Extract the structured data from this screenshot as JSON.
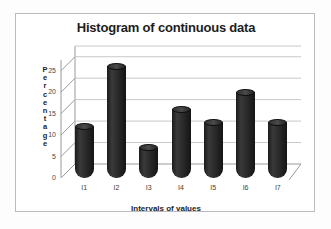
{
  "chart_data": {
    "type": "bar",
    "title": "Histogram of continuous data",
    "xlabel": "Intervals of values",
    "ylabel": "Percentage",
    "ylabel_letters": [
      "P",
      "e",
      "r",
      "c",
      "e",
      "n",
      "t",
      "a",
      "g",
      "e"
    ],
    "categories": [
      "I1",
      "I2",
      "I3",
      "I4",
      "I5",
      "I6",
      "I7"
    ],
    "values": [
      12,
      26,
      7,
      16,
      13,
      20,
      13
    ],
    "yticks": [
      0,
      5,
      10,
      15,
      20,
      25
    ],
    "ylim": [
      0,
      27.5
    ],
    "grid": true,
    "legend": "none",
    "style": "3d-cylinder",
    "bar_color": "#262626",
    "grid_color": "#c9c9c9",
    "axis_color": "#9a9a9a",
    "plot_background": "#ffffff",
    "frame_border_color": "#b9bcc0"
  }
}
